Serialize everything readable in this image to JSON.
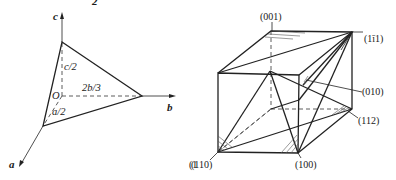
{
  "figure": {
    "left_panel": {
      "title_fragment": "2",
      "axes": {
        "a": "a",
        "b": "b",
        "c": "c",
        "origin": "O"
      },
      "intercepts": {
        "a": "a/2",
        "b": "2b/3",
        "c": "c/2"
      },
      "side_fragment": "(1"
    },
    "right_panel": {
      "planes": [
        {
          "label": "(001)"
        },
        {
          "label": "(1ī1)"
        },
        {
          "label": "(010)"
        },
        {
          "label": "(112)"
        },
        {
          "label": "(110)"
        },
        {
          "label": "(100)"
        }
      ]
    }
  }
}
